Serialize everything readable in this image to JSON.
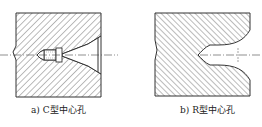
{
  "figures": [
    {
      "id": "a",
      "caption": "a) C型中心孔",
      "type": "C-type center hole"
    },
    {
      "id": "b",
      "caption": "b) R型中心孔",
      "type": "R-type center hole"
    }
  ],
  "colors": {
    "line": "#333333",
    "hatch": "#555555",
    "background": "#ffffff"
  }
}
